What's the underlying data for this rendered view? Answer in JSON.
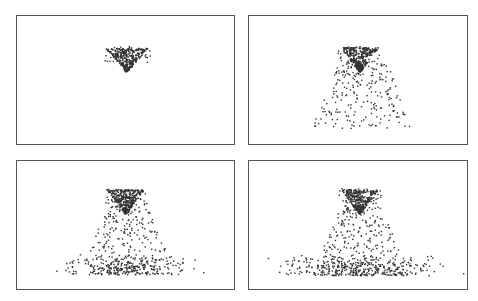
{
  "figure": {
    "panel_count": 4,
    "layout": "2x2 grid",
    "colors": {
      "frame": "#555555",
      "particle": "#333333",
      "background": "#ffffff"
    }
  },
  "panels": [
    {
      "id": "t1",
      "x": 16,
      "y": 15,
      "w": 219,
      "h": 130,
      "stage": "initial jet",
      "cone": {
        "cx": 109,
        "top": 32,
        "tip": 55,
        "halfwidth": 20
      },
      "spray": {
        "count": 40,
        "x0": 87,
        "x1": 133,
        "y0": 30,
        "y1": 47
      },
      "falling": {
        "count": 0
      },
      "base": {
        "count": 0
      }
    },
    {
      "id": "t2",
      "x": 248,
      "y": 15,
      "w": 220,
      "h": 130,
      "stage": "falling curtain",
      "cone": {
        "cx": 110,
        "top": 31,
        "tip": 55,
        "halfwidth": 18
      },
      "spray": {
        "count": 40,
        "x0": 88,
        "x1": 130,
        "y0": 30,
        "y1": 45
      },
      "falling": {
        "count": 230,
        "x0": 62,
        "x1": 165,
        "y0": 45,
        "y1": 112
      },
      "base": {
        "count": 0
      }
    },
    {
      "id": "t3",
      "x": 16,
      "y": 160,
      "w": 219,
      "h": 130,
      "stage": "impact spread",
      "cone": {
        "cx": 108,
        "top": 28,
        "tip": 52,
        "halfwidth": 18
      },
      "spray": {
        "count": 40,
        "x0": 88,
        "x1": 130,
        "y0": 27,
        "y1": 42
      },
      "falling": {
        "count": 170,
        "x0": 70,
        "x1": 150,
        "y0": 42,
        "y1": 92
      },
      "base": {
        "count": 330,
        "x0": 38,
        "x1": 180,
        "y0": 92,
        "y1": 113,
        "outlier_x": 186
      }
    },
    {
      "id": "t4",
      "x": 248,
      "y": 160,
      "w": 220,
      "h": 130,
      "stage": "wide spread",
      "cone": {
        "cx": 110,
        "top": 28,
        "tip": 52,
        "halfwidth": 18
      },
      "spray": {
        "count": 40,
        "x0": 88,
        "x1": 132,
        "y0": 27,
        "y1": 42
      },
      "falling": {
        "count": 170,
        "x0": 70,
        "x1": 152,
        "y0": 42,
        "y1": 92
      },
      "base": {
        "count": 430,
        "x0": 10,
        "x1": 205,
        "y0": 92,
        "y1": 114,
        "outlier_x": 214
      }
    }
  ]
}
